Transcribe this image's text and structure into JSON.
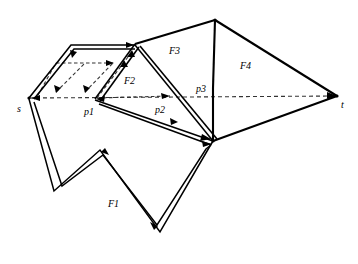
{
  "figure": {
    "background": "#ffffff",
    "stroke_color": "#000000",
    "dashed_color": "#222222"
  },
  "labels": {
    "source": "s",
    "target": "t",
    "port1": "p1",
    "port2": "p2",
    "port3": "p3",
    "face1": "F1",
    "face2": "F2",
    "face3": "F3",
    "face4": "F4"
  },
  "label_positions": {
    "source": {
      "x": 17,
      "y": 110
    },
    "target": {
      "x": 341,
      "y": 107
    },
    "port1": {
      "x": 85,
      "y": 114
    },
    "port2": {
      "x": 156,
      "y": 112
    },
    "port3": {
      "x": 196,
      "y": 91
    },
    "face1": {
      "x": 110,
      "y": 205
    },
    "face2": {
      "x": 126,
      "y": 82
    },
    "face3": {
      "x": 170,
      "y": 52
    },
    "face4": {
      "x": 241,
      "y": 67
    }
  },
  "vertices": {
    "s": {
      "x": 29,
      "y": 98
    },
    "t": {
      "x": 337,
      "y": 96
    },
    "top_left": {
      "x": 71,
      "y": 45
    },
    "top_mid": {
      "x": 135,
      "y": 44
    },
    "apex": {
      "x": 215,
      "y": 20
    },
    "hub": {
      "x": 213,
      "y": 141
    },
    "p1": {
      "x": 96,
      "y": 99
    },
    "p2": {
      "x": 135,
      "y": 44
    },
    "p3_bend": {
      "x": 213,
      "y": 88
    },
    "f1_notch_in": {
      "x": 100,
      "y": 150
    },
    "f1_left_bottom": {
      "x": 54,
      "y": 190
    },
    "f1_bottom_right": {
      "x": 160,
      "y": 231
    },
    "f1_right_top": {
      "x": 209,
      "y": 146
    }
  },
  "geometry": {
    "solid_polylines": [
      {
        "name": "outer-funnel-upper",
        "points": "29,98 71,45 135,44"
      },
      {
        "name": "outer-funnel-inner",
        "points": "34,98 74,48 134,48"
      },
      {
        "name": "triangle-f2-left",
        "points": "96,99 135,44"
      },
      {
        "name": "triangle-f2-left-inner",
        "points": "100,100 138,46"
      },
      {
        "name": "chain-p1-hub-outer",
        "points": "96,99 213,141"
      },
      {
        "name": "chain-p1-hub-inner",
        "points": "99,103 211,144"
      },
      {
        "name": "chain-top-hub-outer",
        "points": "135,44 213,141"
      },
      {
        "name": "chain-top-hub-inner",
        "points": "139,45 216,139"
      },
      {
        "name": "f3-left-edge",
        "points": "135,44 215,20"
      },
      {
        "name": "f3-right-edge",
        "points": "215,20 213,88"
      },
      {
        "name": "f3-lower-edge",
        "points": "213,88 213,141"
      },
      {
        "name": "f4-top-edge",
        "points": "215,20 337,96"
      },
      {
        "name": "f4-bottom-edge",
        "points": "337,96 213,141"
      },
      {
        "name": "f1-outer",
        "points": "29,98 54,190 100,150 160,231 209,146"
      },
      {
        "name": "f1-inner",
        "points": "34,101 62,186 103,155 157,225 206,148"
      },
      {
        "name": "f1-link-top",
        "points": "209,146 213,141"
      },
      {
        "name": "f1-link-top-inner",
        "points": "206,148 211,144"
      }
    ],
    "dashed_polylines": [
      {
        "name": "st-line",
        "points": "29,98 337,96"
      },
      {
        "name": "inner-funnel-path",
        "points": "56,63 113,63 113,92 96,99"
      },
      {
        "name": "funnel-diag-a",
        "points": "56,92 85,63"
      },
      {
        "name": "funnel-diag-b",
        "points": "84,92 113,63"
      },
      {
        "name": "f2-dashed-left",
        "points": "96,99 127,58"
      },
      {
        "name": "f2-dashed-base",
        "points": "96,99 169,97"
      }
    ],
    "arrowheads": [
      {
        "name": "arrow-top-right",
        "x": 131,
        "y": 45,
        "angle": 0
      },
      {
        "name": "arrow-inner-right",
        "x": 112,
        "y": 63,
        "angle": 0
      },
      {
        "name": "arrow-funnel-down-a",
        "x": 58,
        "y": 90,
        "angle": 135
      },
      {
        "name": "arrow-funnel-down-b",
        "x": 86,
        "y": 90,
        "angle": 135
      },
      {
        "name": "arrow-up-left",
        "x": 73,
        "y": 52,
        "angle": 225
      },
      {
        "name": "arrow-up-f2",
        "x": 129,
        "y": 52,
        "angle": 305
      },
      {
        "name": "arrow-s-in",
        "x": 36,
        "y": 99,
        "angle": 180
      },
      {
        "name": "arrow-p1-in",
        "x": 100,
        "y": 99,
        "angle": 190
      },
      {
        "name": "arrow-f2-dash-down",
        "x": 166,
        "y": 96,
        "angle": 10
      },
      {
        "name": "arrow-hub-a",
        "x": 208,
        "y": 138,
        "angle": 40
      },
      {
        "name": "arrow-hub-b",
        "x": 208,
        "y": 143,
        "angle": 20
      },
      {
        "name": "arrow-mid-chain",
        "x": 178,
        "y": 121,
        "angle": 40
      },
      {
        "name": "arrow-t-in",
        "x": 332,
        "y": 96,
        "angle": 0
      },
      {
        "name": "arrow-f1-notch",
        "x": 103,
        "y": 152,
        "angle": 205
      },
      {
        "name": "arrow-f1-bottom",
        "x": 156,
        "y": 224,
        "angle": 55
      }
    ]
  }
}
